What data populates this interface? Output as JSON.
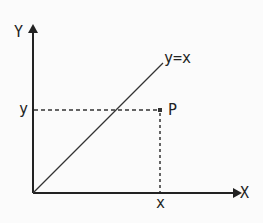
{
  "diagram": {
    "title": "",
    "axes": {
      "x_axis_label": "X",
      "y_axis_label": "Y"
    },
    "line": {
      "label": "y=x"
    },
    "point": {
      "label": "P",
      "x_label": "x",
      "y_label": "y"
    },
    "colors": {
      "ink": "#222222",
      "background": "#fbfbfb"
    }
  }
}
